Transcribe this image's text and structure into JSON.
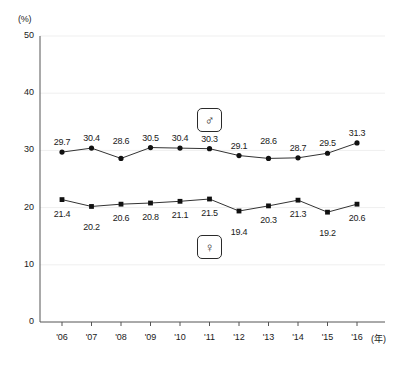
{
  "chart_data": {
    "type": "line",
    "title": "",
    "xlabel": "(年)",
    "ylabel": "(%)",
    "unit_y": "(%)",
    "unit_x": "(年)",
    "categories": [
      "'06",
      "'07",
      "'08",
      "'09",
      "'10",
      "'11",
      "'12",
      "'13",
      "'14",
      "'15",
      "'16"
    ],
    "ylim": [
      0,
      50
    ],
    "ytick_labels": [
      "0",
      "10",
      "20",
      "30",
      "40",
      "50"
    ],
    "ytick_values": [
      0,
      10,
      20,
      30,
      40,
      50
    ],
    "grid": true,
    "legend_position": "inside-center",
    "series": [
      {
        "name": "male",
        "legend_symbol": "♂",
        "marker": "circle",
        "values": [
          29.7,
          30.4,
          28.6,
          30.5,
          30.4,
          30.3,
          29.1,
          28.6,
          28.7,
          29.5,
          31.3
        ],
        "labels": [
          "29.7",
          "30.4",
          "28.6",
          "30.5",
          "30.4",
          "30.3",
          "29.1",
          "28.6",
          "28.7",
          "29.5",
          "31.3"
        ],
        "label_positions": [
          "above",
          "above",
          "above",
          "above",
          "above",
          "above",
          "above",
          "above",
          "above",
          "above",
          "above"
        ]
      },
      {
        "name": "female",
        "legend_symbol": "♀",
        "marker": "square",
        "values": [
          21.4,
          20.2,
          20.6,
          20.8,
          21.1,
          21.5,
          19.4,
          20.3,
          21.3,
          19.2,
          20.6
        ],
        "labels": [
          "21.4",
          "20.2",
          "20.6",
          "20.8",
          "21.1",
          "21.5",
          "19.4",
          "20.3",
          "21.3",
          "19.2",
          "20.6"
        ],
        "label_positions": [
          "below",
          "below",
          "below",
          "below",
          "below",
          "below",
          "below",
          "below",
          "below",
          "below",
          "below"
        ]
      }
    ],
    "colors": {
      "line": "#333333",
      "marker": "#111111",
      "axis": "#555555",
      "grid": "#efefef",
      "text": "#1a1a1a"
    }
  }
}
